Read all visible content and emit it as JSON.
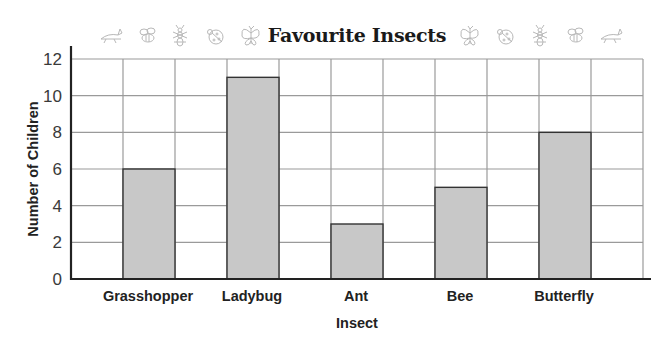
{
  "chart_data": {
    "type": "bar",
    "title": "Favourite Insects",
    "xlabel": "Insect",
    "ylabel": "Number of Children",
    "categories": [
      "Grasshopper",
      "Ladybug",
      "Ant",
      "Bee",
      "Butterfly"
    ],
    "values": [
      6,
      11,
      3,
      5,
      8
    ],
    "ylim": [
      0,
      12
    ],
    "yticks": [
      0,
      2,
      4,
      6,
      8,
      10,
      12
    ],
    "grid": true,
    "legend": null,
    "bar_color": "#c8c8c8",
    "bar_edge_color": "#333333",
    "grid_color": "#9a9a9a",
    "decorations": {
      "left_icons": [
        "grasshopper-icon",
        "bee-icon",
        "ant-icon",
        "ladybug-icon",
        "butterfly-icon"
      ],
      "right_icons": [
        "butterfly-icon",
        "ladybug-icon",
        "ant-icon",
        "bee-icon",
        "grasshopper-icon"
      ]
    }
  }
}
